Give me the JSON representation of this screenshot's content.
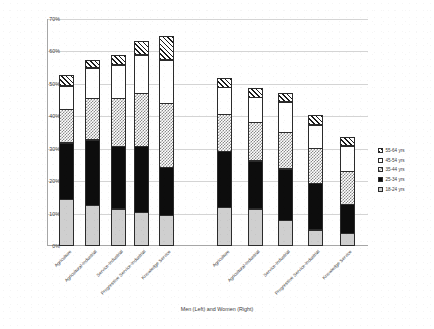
{
  "chart_data": {
    "type": "bar",
    "subtype": "stacked-bar",
    "title": "",
    "xlabel": "Men (Left) and Women (Right)",
    "ylabel": "Proportion TEA Active",
    "ylim": [
      0,
      70
    ],
    "ytick_labels": [
      "0%",
      "10%",
      "20%",
      "30%",
      "40%",
      "50%",
      "60%",
      "70%"
    ],
    "ytick_values": [
      0,
      10,
      20,
      30,
      40,
      50,
      60,
      70
    ],
    "grid": true,
    "legend_position": "right",
    "groups": [
      "Men (Left)",
      "Women (Right)"
    ],
    "categories": [
      "Agriculture",
      "Agricultural-Industrial",
      "Service-Industrial",
      "Progressive Service-Industrial",
      "Knowledge Service"
    ],
    "series": [
      {
        "name": "18-24 yrs",
        "pattern": "light-grey-solid",
        "men": [
          14.5,
          12.5,
          11.5,
          10.5,
          9.5
        ],
        "women": [
          12.0,
          11.5,
          8.0,
          5.0,
          4.0
        ]
      },
      {
        "name": "25-34 yrs",
        "pattern": "black-solid",
        "men": [
          17.5,
          20.5,
          19.5,
          20.5,
          15.0
        ],
        "women": [
          17.5,
          15.0,
          16.0,
          14.5,
          9.0
        ]
      },
      {
        "name": "35-44 yrs",
        "pattern": "checker",
        "men": [
          10.5,
          13.0,
          15.0,
          16.5,
          20.0
        ],
        "women": [
          11.5,
          12.0,
          11.5,
          11.0,
          10.5
        ]
      },
      {
        "name": "45-54 yrs",
        "pattern": "white",
        "men": [
          7.5,
          9.5,
          10.5,
          12.0,
          13.5
        ],
        "women": [
          8.5,
          8.0,
          9.5,
          7.5,
          8.0
        ]
      },
      {
        "name": "55-64 yrs",
        "pattern": "diagonal-hatch",
        "men": [
          3.5,
          2.5,
          3.0,
          4.5,
          7.5
        ],
        "women": [
          3.0,
          3.0,
          3.0,
          3.0,
          3.0
        ]
      }
    ],
    "totals": {
      "men": [
        53.5,
        58.0,
        59.5,
        64.0,
        65.5
      ],
      "women": [
        52.5,
        49.5,
        48.0,
        41.0,
        34.5
      ]
    },
    "legend": [
      "55-64 yrs",
      "45-54 yrs",
      "35-44 yrs",
      "25-34 yrs",
      "18-24 yrs"
    ]
  }
}
